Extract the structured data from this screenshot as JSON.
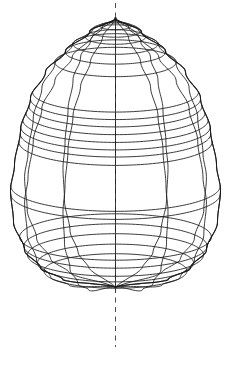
{
  "figure": {
    "title": "",
    "type": "3d-wireframe-surface-of-revolution",
    "object_name": "ovoid-wireframe",
    "background_color": "#ffffff",
    "line_color": "#1a1a1a",
    "axis_color": "#3a3a3a",
    "axis_style": "dashed"
  },
  "geometry": {
    "canvas_width": 237,
    "canvas_height": 365,
    "axis_x": 115.5,
    "apex_y": 18,
    "base_y": 287,
    "equator_y": 190,
    "half_width_max": 105,
    "left_extent_x": 12,
    "right_extent_x": 223,
    "axis_line_top_y": 3,
    "axis_line_bottom_y": 347,
    "view_tilt_degrees": 14,
    "meridian_count": 12,
    "visible_meridian_x": [
      14,
      50,
      87,
      115.5,
      124,
      160,
      196,
      223
    ],
    "latitude_count": 22,
    "latitude_y_values": [
      22,
      26,
      31,
      37,
      44,
      52,
      62,
      92,
      99,
      106,
      113,
      120,
      127,
      134,
      142,
      186,
      194,
      237,
      246,
      255,
      263,
      271
    ],
    "profile_radii": [
      {
        "t": 0.0,
        "y": 18,
        "r": 0
      },
      {
        "t": 0.05,
        "y": 32,
        "r": 26
      },
      {
        "t": 0.12,
        "y": 51,
        "r": 50
      },
      {
        "t": 0.2,
        "y": 72,
        "r": 70
      },
      {
        "t": 0.3,
        "y": 98,
        "r": 85
      },
      {
        "t": 0.42,
        "y": 130,
        "r": 95
      },
      {
        "t": 0.55,
        "y": 165,
        "r": 101
      },
      {
        "t": 0.64,
        "y": 190,
        "r": 105
      },
      {
        "t": 0.76,
        "y": 222,
        "r": 102
      },
      {
        "t": 0.86,
        "y": 250,
        "r": 91
      },
      {
        "t": 0.93,
        "y": 268,
        "r": 75
      },
      {
        "t": 0.97,
        "y": 280,
        "r": 52
      },
      {
        "t": 1.0,
        "y": 287,
        "r": 0
      }
    ]
  },
  "chart_data": {
    "type": "line",
    "title": "",
    "xlabel": "",
    "ylabel": "",
    "series": [
      {
        "name": "profile-generatrix",
        "x": [
          0,
          26,
          50,
          70,
          85,
          95,
          101,
          105,
          102,
          91,
          75,
          52,
          0
        ],
        "y": [
          18,
          32,
          51,
          72,
          98,
          130,
          165,
          190,
          222,
          250,
          268,
          280,
          287
        ]
      }
    ]
  }
}
